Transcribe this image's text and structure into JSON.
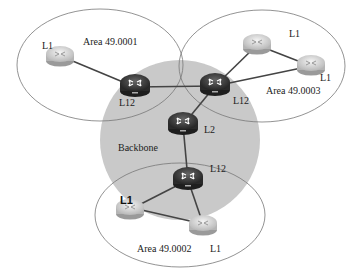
{
  "diagram": {
    "colors": {
      "backbone_fill": "#c9c9c9",
      "area_stroke": "#777777",
      "link": "#444444",
      "router_dark": "#3a3a3a",
      "router_light": "#d8d8d8"
    },
    "areas": [
      {
        "id": "area1",
        "label": "Area 49.0001"
      },
      {
        "id": "area3",
        "label": "Area 49.0003"
      },
      {
        "id": "area2",
        "label": "Area 49.0002"
      },
      {
        "id": "backbone",
        "label": "Backbone"
      }
    ],
    "routers": [
      {
        "id": "r1_l1",
        "label": "L1",
        "type": "light",
        "area": "Area 49.0001"
      },
      {
        "id": "r1_l12",
        "label": "L12",
        "type": "dark",
        "area": "Area 49.0001"
      },
      {
        "id": "r3_l12",
        "label": "L12",
        "type": "dark",
        "area": "Area 49.0003"
      },
      {
        "id": "r3_l1a",
        "label": "L1",
        "type": "light",
        "area": "Area 49.0003"
      },
      {
        "id": "r3_l1b",
        "label": "L1",
        "type": "light",
        "area": "Area 49.0003"
      },
      {
        "id": "bb_l2",
        "label": "L2",
        "type": "dark",
        "area": "Backbone"
      },
      {
        "id": "r2_l12",
        "label": "L12",
        "type": "dark",
        "area": "Area 49.0002"
      },
      {
        "id": "r2_l1a",
        "label": "L1",
        "type": "light",
        "area": "Area 49.0002"
      },
      {
        "id": "r2_l1b",
        "label": "L1",
        "type": "light",
        "area": "Area 49.0002"
      }
    ],
    "links": [
      [
        "r1_l1",
        "r1_l12"
      ],
      [
        "r1_l12",
        "r3_l12"
      ],
      [
        "r3_l12",
        "r3_l1a"
      ],
      [
        "r3_l12",
        "r3_l1b"
      ],
      [
        "r3_l1a",
        "r3_l1b"
      ],
      [
        "r3_l12",
        "bb_l2"
      ],
      [
        "bb_l2",
        "r2_l12"
      ],
      [
        "r2_l12",
        "r2_l1a"
      ],
      [
        "r2_l12",
        "r2_l1b"
      ],
      [
        "r2_l1a",
        "r2_l1b"
      ]
    ]
  }
}
